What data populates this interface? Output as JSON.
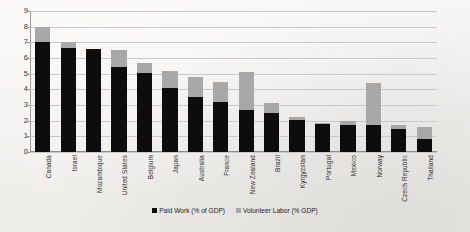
{
  "chart_data": {
    "type": "bar",
    "subtype": "stacked-column",
    "title": "",
    "xlabel": "",
    "ylabel": "",
    "ylim": [
      0,
      9
    ],
    "ytick_step": 1,
    "yticks": [
      "9",
      "8",
      "7",
      "6",
      "5",
      "4",
      "3",
      "2",
      "1",
      "0"
    ],
    "grid": true,
    "legend_position": "bottom-center",
    "categories": [
      "Canada",
      "Israel",
      "Mozambique",
      "United States",
      "Belgium",
      "Japan",
      "Australia",
      "France",
      "New Zealand",
      "Brazil",
      "Kyrgyzstan",
      "Portugal",
      "Mexico",
      "Norway",
      "Czech Republic",
      "Thailand"
    ],
    "series": [
      {
        "name": "Paid Work (% of GDP)",
        "color": "#0d0d0d",
        "values": [
          7.0,
          6.65,
          6.55,
          5.4,
          5.05,
          4.1,
          3.5,
          3.2,
          2.7,
          2.5,
          2.05,
          1.8,
          1.75,
          1.7,
          1.5,
          0.85
        ]
      },
      {
        "name": "Volunteer Labor (% GDP)",
        "color": "#a8a8a8",
        "values": [
          1.0,
          0.4,
          0.0,
          1.1,
          0.65,
          1.1,
          1.3,
          1.3,
          2.4,
          0.6,
          0.2,
          0.05,
          0.2,
          2.7,
          0.2,
          0.75
        ]
      }
    ],
    "totals": [
      8.0,
      7.05,
      6.55,
      6.5,
      5.7,
      5.2,
      4.8,
      4.5,
      5.1,
      3.1,
      2.25,
      1.85,
      1.95,
      4.4,
      1.7,
      1.6
    ]
  },
  "legend": {
    "items": [
      {
        "label": "Paid Work (% of GDP)",
        "swatch": "black-square-icon"
      },
      {
        "label": "Volunteer Labor (% GDP)",
        "swatch": "gray-square-icon"
      }
    ]
  },
  "colors": {
    "paid": "#0d0d0d",
    "volunteer": "#a8a8a8",
    "grid": "#c9c9c9",
    "axis": "#8e8e8e",
    "background": "#f4f3f1",
    "text": "#2b2b2b"
  }
}
